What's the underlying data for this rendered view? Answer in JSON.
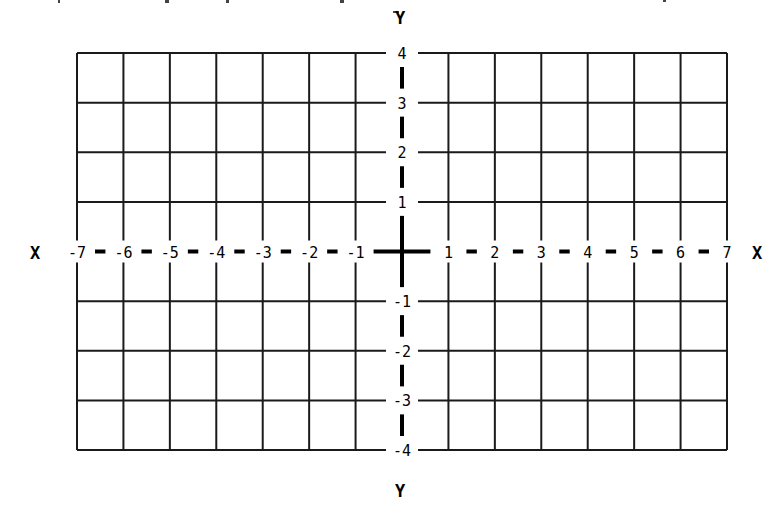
{
  "diagram": {
    "type": "coordinate-plane",
    "axes": {
      "x_label_left": "X",
      "x_label_right": "X",
      "y_label_top": "Y",
      "y_label_bottom": "Y"
    },
    "x_range": [
      -7,
      7
    ],
    "y_range": [
      -4,
      4
    ],
    "x_tick_labels": [
      "-7",
      "-6",
      "-5",
      "-4",
      "-3",
      "-2",
      "-1",
      "1",
      "2",
      "3",
      "4",
      "5",
      "6",
      "7"
    ],
    "y_tick_labels": [
      "4",
      "3",
      "2",
      "1",
      "-1",
      "-2",
      "-3",
      "-4"
    ],
    "grid": {
      "columns": 14,
      "rows": 8,
      "line_color": "#1a1a1a",
      "axis_color": "#000000",
      "background": "#ffffff"
    }
  },
  "chart_data": {
    "type": "grid",
    "title": "",
    "xlabel": "X",
    "ylabel": "Y",
    "xlim": [
      -7,
      7
    ],
    "ylim": [
      -4,
      4
    ],
    "x_ticks": [
      -7,
      -6,
      -5,
      -4,
      -3,
      -2,
      -1,
      1,
      2,
      3,
      4,
      5,
      6,
      7
    ],
    "y_ticks": [
      -4,
      -3,
      -2,
      -1,
      1,
      2,
      3,
      4
    ],
    "grid": true,
    "series": []
  }
}
